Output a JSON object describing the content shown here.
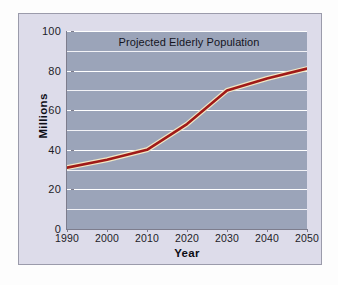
{
  "chart_data": {
    "type": "line",
    "title": "Projected Elderly Population",
    "xlabel": "Year",
    "ylabel": "Millions",
    "x": [
      1990,
      2000,
      2010,
      2020,
      2030,
      2040,
      2050
    ],
    "values": [
      31,
      35,
      40,
      53,
      70,
      76,
      81
    ],
    "series": [
      {
        "name": "Projected Elderly Population",
        "values": [
          31,
          35,
          40,
          53,
          70,
          76,
          81
        ]
      }
    ],
    "xtick_labels": [
      "1990",
      "2000",
      "2010",
      "2020",
      "2030",
      "2040",
      "2050"
    ],
    "ytick_labels": [
      "0",
      "20",
      "40",
      "60",
      "80",
      "100"
    ],
    "ytick_values": [
      0,
      20,
      40,
      60,
      80,
      100
    ],
    "xlim": [
      1990,
      2050
    ],
    "ylim": [
      0,
      100
    ],
    "grid": "horizontal",
    "gridline_interval": 10,
    "legend": "none",
    "line_color": "#a01a18",
    "line_highlight_color": "#f0e6c0",
    "plot_background": "#9ba4b9",
    "figure_background": "#dddcea",
    "gridline_color": "#ffffff"
  }
}
